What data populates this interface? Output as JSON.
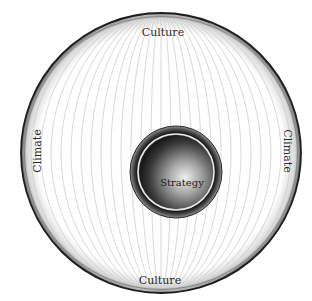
{
  "diagram": {
    "outer_ring": {
      "top_label": "Culture",
      "bottom_label": "Culture",
      "left_label": "Climate",
      "right_label": "Climate"
    },
    "core": {
      "label": "Strategy"
    },
    "colors": {
      "ring_stroke": "#1e1e1e",
      "meridian_lines": "#c8c8c8",
      "core_dark": "#1a1a1a",
      "core_light": "#e6e6e6"
    }
  }
}
